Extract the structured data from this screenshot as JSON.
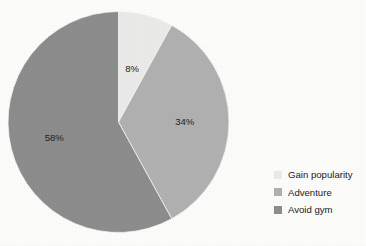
{
  "chart_data": {
    "type": "pie",
    "title": "",
    "subtitle": "",
    "xlabel": "",
    "ylabel": "",
    "legend_position": "right",
    "grid": false,
    "start_angle_deg": 0,
    "direction": "clockwise",
    "categories": [
      "Gain popularity",
      "Adventure",
      "Avoid gym"
    ],
    "values": [
      8,
      34,
      58
    ],
    "unit": "%",
    "slices": [
      {
        "label": "Gain popularity",
        "value": 8,
        "data_label": "8%",
        "color": "#ebebe9"
      },
      {
        "label": "Adventure",
        "value": 34,
        "data_label": "34%",
        "color": "#b1b1b1"
      },
      {
        "label": "Avoid gym",
        "value": 58,
        "data_label": "58%",
        "color": "#8d8d8d"
      }
    ]
  },
  "legend": {
    "items": [
      {
        "label": "Gain popularity",
        "color": "#ebebe9"
      },
      {
        "label": "Adventure",
        "color": "#b1b1b1"
      },
      {
        "label": "Avoid gym",
        "color": "#8d8d8d"
      }
    ]
  },
  "colors": {
    "background": "#fdfdfc",
    "label_text": "#1d1d1d",
    "legend_text": "#232323",
    "slice_edge": "#f7f7f6"
  }
}
